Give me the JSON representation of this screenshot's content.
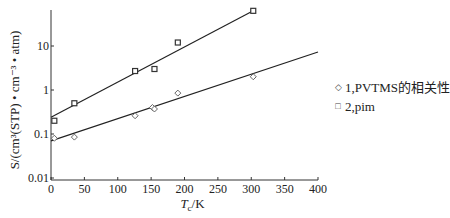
{
  "chart_data": {
    "type": "scatter",
    "title": "",
    "xlabel": "Tc/K",
    "xlabel_main": "T",
    "xlabel_sub": "c",
    "xlabel_unit": "/K",
    "ylabel": "S/(cm³(STP) • cm⁻³ • atm)",
    "xlim": [
      0,
      400
    ],
    "ylim": [
      0.01,
      70
    ],
    "yscale": "log",
    "x_ticks": [
      0,
      50,
      100,
      150,
      200,
      250,
      300,
      350,
      400
    ],
    "y_ticks": [
      0.01,
      0.1,
      1,
      10
    ],
    "y_tick_labels": [
      "0.01",
      "0.1",
      "1",
      "10"
    ],
    "grid": false,
    "legend_position": "right",
    "series": [
      {
        "name": "1,PVTMS的相关性",
        "marker": "diamond",
        "points": [
          [
            5,
            0.08
          ],
          [
            35,
            0.085
          ],
          [
            126,
            0.26
          ],
          [
            152,
            0.4
          ],
          [
            155,
            0.37
          ],
          [
            190,
            0.85
          ],
          [
            303,
            2.0
          ]
        ],
        "fit_line": [
          [
            0,
            0.07
          ],
          [
            400,
            7.3
          ]
        ]
      },
      {
        "name": "2,pim",
        "marker": "square",
        "points": [
          [
            5,
            0.2
          ],
          [
            35,
            0.5
          ],
          [
            126,
            2.7
          ],
          [
            155,
            3.0
          ],
          [
            190,
            12
          ],
          [
            303,
            63
          ]
        ],
        "fit_line": [
          [
            0,
            0.24
          ],
          [
            303,
            63
          ]
        ]
      }
    ]
  },
  "legend": {
    "items": [
      {
        "symbol": "◇",
        "label": "1,PVTMS的相关性"
      },
      {
        "symbol": "□",
        "label": "2,pim"
      }
    ]
  }
}
